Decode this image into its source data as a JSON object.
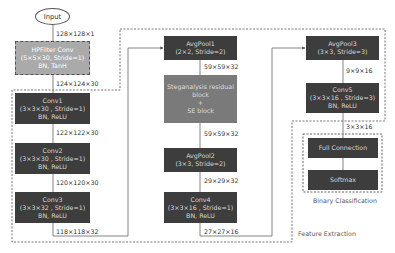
{
  "input": {
    "label": "Input"
  },
  "preprocess": {
    "hpfilter": {
      "title": "HPFilter Conv",
      "params": "(5×5×30, Stride=1)",
      "act": "BN, TanH"
    }
  },
  "column1": [
    {
      "title": "Conv1",
      "params": "(3×3×30 , Stride=1)",
      "act": "BN, ReLU"
    },
    {
      "title": "Conv2",
      "params": "(3×3×30 , Stride=1)",
      "act": "BN, ReLU"
    },
    {
      "title": "Conv3",
      "params": "(3×3×32 , Stride=1)",
      "act": "BN, ReLU"
    }
  ],
  "column2": {
    "avgpool1": {
      "title": "AvgPool1",
      "params": "(2×2, Stride=2)"
    },
    "residual": {
      "line1": "Steganalysis residual",
      "line2": "block",
      "line3": "+",
      "line4": "SE block"
    },
    "avgpool2": {
      "title": "AvgPool2",
      "params": "(3×3, Stride=2)"
    },
    "conv4": {
      "title": "Conv4",
      "params": "(3×3×16 , Stride=1)",
      "act": "BN, ReLU"
    }
  },
  "column3": {
    "avgpool3": {
      "title": "AvgPool3",
      "params": "(3×3, Stride=3)"
    },
    "conv5": {
      "title": "Conv5",
      "params": "(3×3×16 , Stride=3)",
      "act": "BN, ReLU"
    },
    "fc": {
      "title": "Full Connection"
    },
    "softmax": {
      "title": "Softmax"
    }
  },
  "dims": {
    "d0": "128×128×1",
    "d1": "124×124×30",
    "d2": "122×122×30",
    "d3": "120×120×30",
    "d4": "118×118×32",
    "d5": "59×59×32",
    "d6": "59×59×32",
    "d7": "29×29×32",
    "d8": "27×27×16",
    "d9": "9×9×16",
    "d10": "3×3×16"
  },
  "captions": {
    "binary": "Binary Classification",
    "feature": "Feature Extraction"
  }
}
